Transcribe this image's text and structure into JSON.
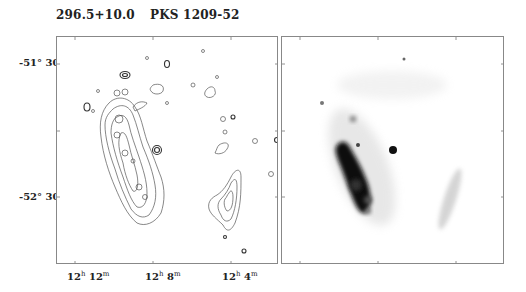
{
  "figure": {
    "title_left": "296.5+10.0",
    "title_right": "PKS 1209-52",
    "y_axis": {
      "label": "Declination",
      "ticks": [
        {
          "deg": "-51°",
          "min": "30′"
        },
        {
          "deg": "-52°",
          "min": "30′"
        }
      ]
    },
    "x_axis": {
      "label": "Right Ascension",
      "ticks": [
        {
          "h": "12",
          "hu": "h",
          "m": "12",
          "mu": "m"
        },
        {
          "h": "12",
          "hu": "h",
          "m": "8",
          "mu": "m"
        },
        {
          "h": "12",
          "hu": "h",
          "m": "4",
          "mu": "m"
        }
      ]
    },
    "panels": [
      {
        "name": "contour-map",
        "description": "Radio/X-ray contour map of supernova remnant 296.5+10.0"
      },
      {
        "name": "greyscale-image",
        "description": "Greyscale intensity image of the same field"
      }
    ],
    "colors": {
      "ink": "#222222",
      "frame": "#888888",
      "contour": "#555555",
      "greyscale": "#111111"
    }
  }
}
